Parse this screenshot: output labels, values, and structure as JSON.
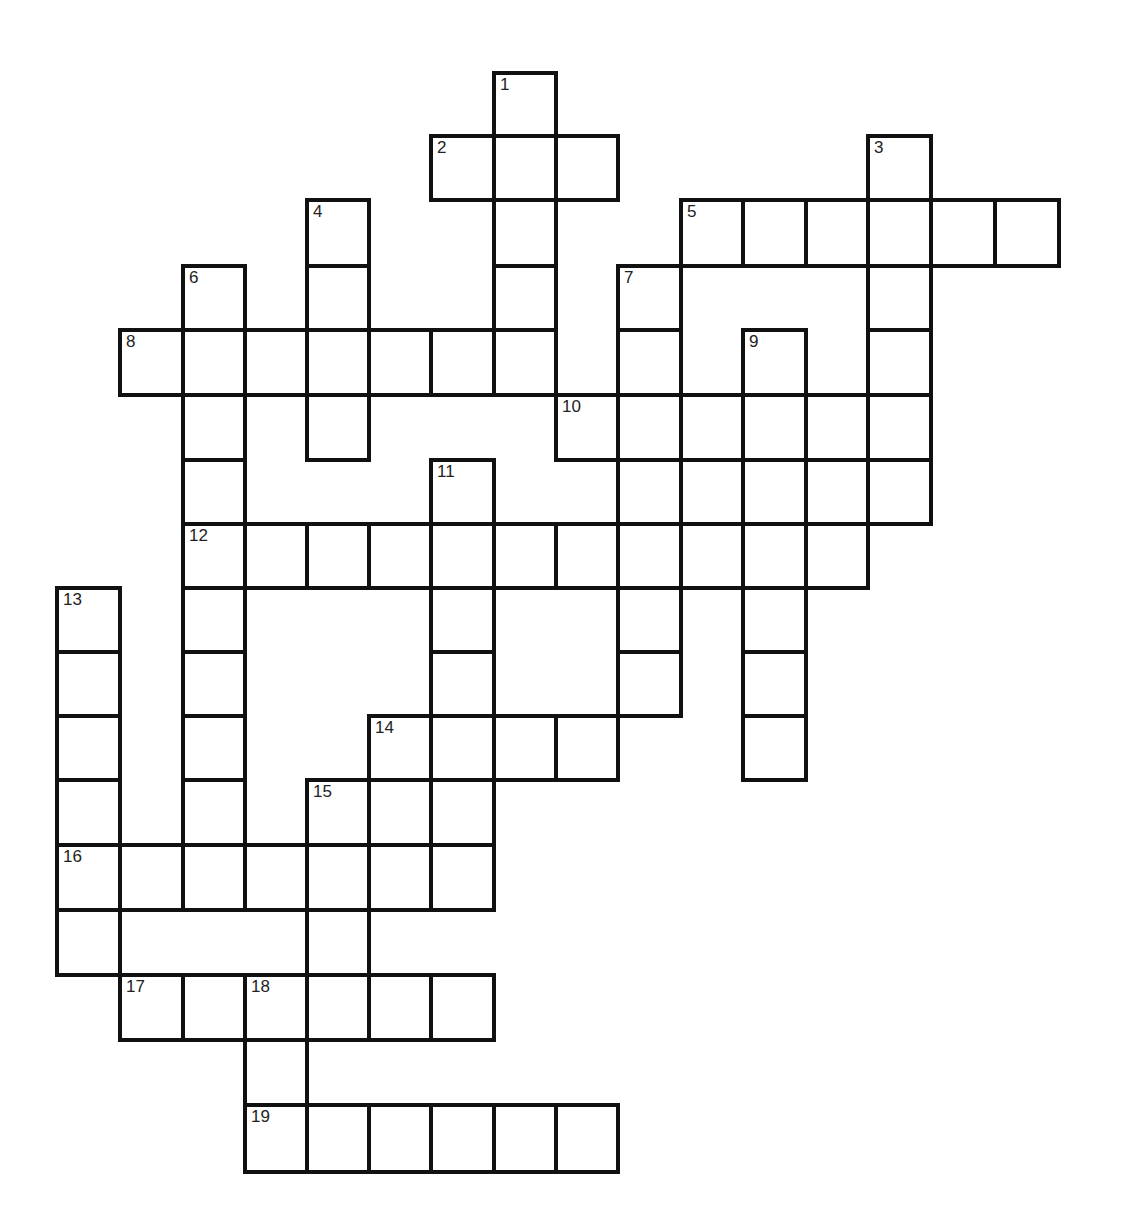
{
  "puzzle": {
    "type": "crossword",
    "col_edges": [
      57,
      120,
      183,
      245,
      307,
      369,
      431,
      494,
      556,
      618,
      681,
      743,
      806,
      868,
      931,
      995,
      1059
    ],
    "row_edges": [
      73,
      136,
      200,
      266,
      330,
      395,
      460,
      524,
      588,
      652,
      716,
      780,
      845,
      910,
      975,
      1040,
      1105,
      1172
    ],
    "border_color": "#111111",
    "cell_color": "#ffffff",
    "entries": [
      {
        "number": "1",
        "direction": "down",
        "row": 0,
        "col": 7,
        "length": 5
      },
      {
        "number": "2",
        "direction": "across",
        "row": 1,
        "col": 6,
        "length": 3
      },
      {
        "number": "3",
        "direction": "down",
        "row": 1,
        "col": 13,
        "length": 6
      },
      {
        "number": "4",
        "direction": "down",
        "row": 2,
        "col": 4,
        "length": 4
      },
      {
        "number": "5",
        "direction": "across",
        "row": 2,
        "col": 10,
        "length": 6
      },
      {
        "number": "6",
        "direction": "down",
        "row": 3,
        "col": 2,
        "length": 9
      },
      {
        "number": "7",
        "direction": "down",
        "row": 3,
        "col": 9,
        "length": 7
      },
      {
        "number": "8",
        "direction": "across",
        "row": 4,
        "col": 1,
        "length": 7
      },
      {
        "number": "9",
        "direction": "down",
        "row": 4,
        "col": 11,
        "length": 7
      },
      {
        "number": "10",
        "direction": "across",
        "row": 5,
        "col": 8,
        "length": 6
      },
      {
        "number": "11",
        "direction": "down",
        "row": 6,
        "col": 6,
        "length": 7
      },
      {
        "number": "12",
        "direction": "across",
        "row": 7,
        "col": 2,
        "length": 11
      },
      {
        "number": "13",
        "direction": "down",
        "row": 8,
        "col": 0,
        "length": 6
      },
      {
        "number": "14",
        "direction": "across",
        "row": 10,
        "col": 5,
        "length": 4
      },
      {
        "number": "15",
        "direction": "down",
        "row": 11,
        "col": 4,
        "length": 4
      },
      {
        "number": "16",
        "direction": "across",
        "row": 12,
        "col": 0,
        "length": 7
      },
      {
        "number": "17",
        "direction": "across",
        "row": 14,
        "col": 1,
        "length": 6
      },
      {
        "number": "18",
        "direction": "down",
        "row": 14,
        "col": 3,
        "length": 3
      },
      {
        "number": "19",
        "direction": "across",
        "row": 16,
        "col": 3,
        "length": 6
      }
    ]
  }
}
